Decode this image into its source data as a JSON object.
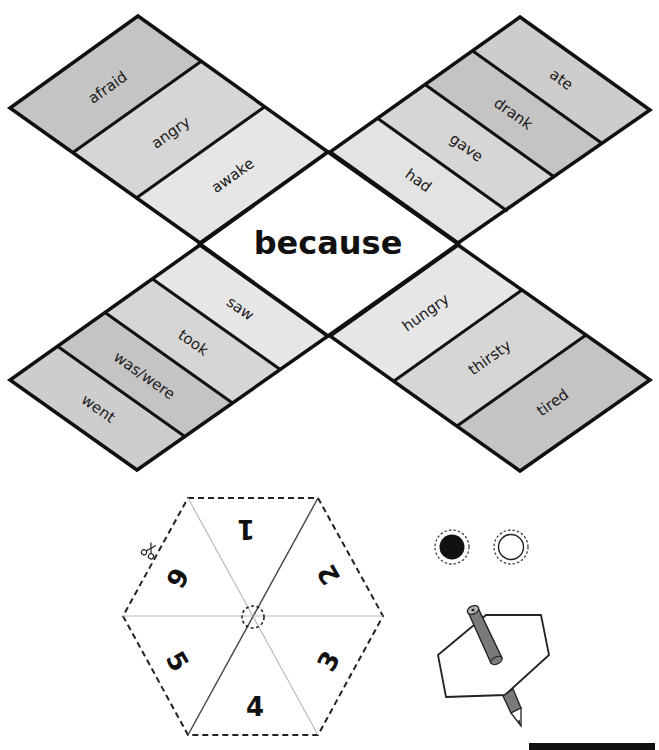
{
  "board": {
    "center_word": "because",
    "quadrants": {
      "top_left": {
        "words": [
          "afraid",
          "angry",
          "awake"
        ]
      },
      "top_right": {
        "words": [
          "ate",
          "drank",
          "gave",
          "had"
        ]
      },
      "bottom_left": {
        "words": [
          "saw",
          "took",
          "was/were",
          "went"
        ]
      },
      "bottom_right": {
        "words": [
          "hungry",
          "thirsty",
          "tired"
        ]
      }
    },
    "colors": {
      "dark_fill": "#c4c4c4",
      "mid_fill": "#d6d6d6",
      "light_fill": "#e6e6e6",
      "outline": "#111111",
      "center_fill": "#ffffff"
    }
  },
  "spinner": {
    "numbers": [
      "1",
      "2",
      "3",
      "4",
      "5",
      "6"
    ],
    "cut_icon": "scissors-icon"
  },
  "counters": {
    "items": [
      {
        "name": "black-counter",
        "fill": "#111111"
      },
      {
        "name": "white-counter",
        "fill": "#ffffff"
      }
    ]
  },
  "illustration": {
    "description": "spinner-with-pencil",
    "pencil_color": "#7a7a7a"
  }
}
